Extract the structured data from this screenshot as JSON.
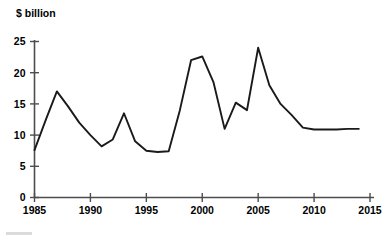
{
  "chart_data": {
    "type": "line",
    "title": "",
    "subtitle": "",
    "xlabel": "",
    "ylabel": "$ billion",
    "ylabel_position": "top-left",
    "grid": false,
    "legend": false,
    "legend_position": "none",
    "xlim": [
      1985,
      2015
    ],
    "ylim": [
      0,
      25
    ],
    "xticks": [
      1985,
      1990,
      1995,
      2000,
      2005,
      2010,
      2015
    ],
    "xtick_labels": [
      "1985",
      "1990",
      "1995",
      "2000",
      "2005",
      "2010",
      "2015"
    ],
    "yticks": [
      0,
      5,
      10,
      15,
      20,
      25
    ],
    "ytick_labels": [
      "0",
      "5",
      "10",
      "15",
      "20",
      "25"
    ],
    "series": [
      {
        "name": "$ billion",
        "color": "#1a1a1a",
        "x": [
          1985,
          1986,
          1987,
          1988,
          1989,
          1990,
          1991,
          1992,
          1993,
          1994,
          1995,
          1996,
          1997,
          1998,
          1999,
          2000,
          2001,
          2002,
          2003,
          2004,
          2005,
          2006,
          2007,
          2008,
          2009,
          2010,
          2011,
          2012,
          2013,
          2014
        ],
        "values": [
          7.6,
          12.4,
          17.0,
          14.6,
          12.0,
          10.0,
          8.2,
          9.3,
          13.5,
          9.0,
          7.5,
          7.3,
          7.4,
          14.0,
          22.0,
          22.6,
          18.5,
          11.0,
          15.2,
          14.0,
          24.0,
          18.0,
          15.0,
          13.2,
          11.2,
          10.9,
          10.9,
          10.9,
          11.0,
          11.0
        ]
      }
    ],
    "annotations": []
  },
  "axis": {
    "y_label": "$ billion"
  },
  "colors": {
    "line": "#1a1a1a",
    "axis": "#4d4d4d",
    "background": "#ffffff"
  }
}
